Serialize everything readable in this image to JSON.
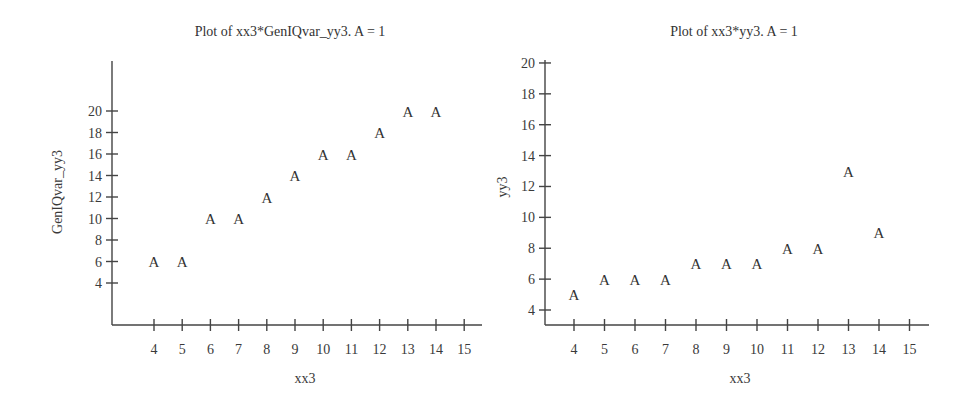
{
  "chart_data": [
    {
      "type": "scatter",
      "title": "Plot of xx3*GenIQvar_yy3. A = 1",
      "xlabel": "xx3",
      "ylabel": "GenIQvar_yy3",
      "marker": "A",
      "x_ticks": [
        4,
        5,
        6,
        7,
        8,
        9,
        10,
        11,
        12,
        13,
        14,
        15
      ],
      "y_ticks": [
        4,
        6,
        8,
        10,
        12,
        14,
        16,
        18,
        20
      ],
      "xlim": [
        2.5,
        15.6
      ],
      "ylim": [
        0,
        24.5
      ],
      "grid": false,
      "legend": "A = 1",
      "x": [
        4,
        5,
        6,
        7,
        8,
        9,
        10,
        11,
        12,
        13,
        14
      ],
      "y": [
        6,
        6,
        10,
        10,
        12,
        14,
        16,
        16,
        18,
        20,
        20
      ],
      "layout": {
        "ox": 112,
        "oy": 325,
        "x0": 4,
        "px_x0": 154,
        "px_per_x": 28.2,
        "y0": 4,
        "px_y0": 283,
        "px_per_y": 10.75,
        "axis_top": 61,
        "axis_right": 482,
        "title_x": 290,
        "title_y": 36,
        "ylabel_x": 62,
        "ylabel_y": 192,
        "xlabel_x": 305,
        "xlabel_y": 383
      }
    },
    {
      "type": "scatter",
      "title": "Plot of xx3*yy3. A = 1",
      "xlabel": "xx3",
      "ylabel": "yy3",
      "marker": "A",
      "x_ticks": [
        4,
        5,
        6,
        7,
        8,
        9,
        10,
        11,
        12,
        13,
        14,
        15
      ],
      "y_ticks": [
        4,
        6,
        8,
        10,
        12,
        14,
        16,
        18,
        20
      ],
      "xlim": [
        3,
        15.6
      ],
      "ylim": [
        3,
        20
      ],
      "grid": false,
      "legend": "A = 1",
      "x": [
        4,
        5,
        6,
        7,
        8,
        9,
        10,
        11,
        12,
        13,
        14
      ],
      "y": [
        5,
        6,
        6,
        6,
        7,
        7,
        7,
        8,
        8,
        13,
        9
      ],
      "layout": {
        "ox": 545,
        "oy": 325,
        "x0": 4,
        "px_x0": 574,
        "px_per_x": 30.5,
        "y0": 4,
        "px_y0": 310,
        "px_per_y": 15.44,
        "axis_top": 60,
        "axis_right": 929,
        "title_x": 734,
        "title_y": 36,
        "ylabel_x": 507,
        "ylabel_y": 187,
        "xlabel_x": 740,
        "xlabel_y": 383
      }
    }
  ]
}
